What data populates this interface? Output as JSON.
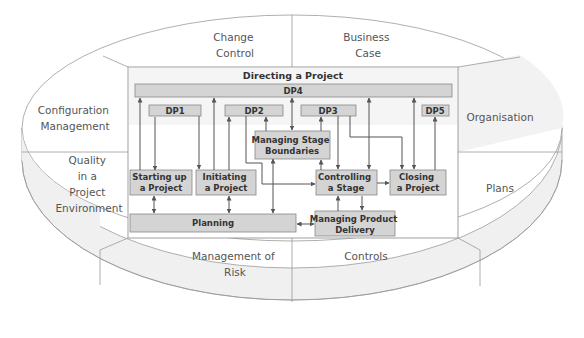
{
  "diagram": {
    "title": "Directing a Project",
    "colors": {
      "box_fill": "#d4d4d4",
      "box_stroke": "#888888",
      "line": "#555555",
      "ellipse_stroke": "#9a9a9a",
      "ellipse_shade": "#f0f0f0",
      "text": "#555555"
    },
    "outer_segments": [
      {
        "id": "change-control",
        "lines": [
          "Change",
          "Control"
        ]
      },
      {
        "id": "business-case",
        "lines": [
          "Business",
          "Case"
        ]
      },
      {
        "id": "organisation",
        "lines": [
          "Organisation"
        ]
      },
      {
        "id": "plans",
        "lines": [
          "Plans"
        ]
      },
      {
        "id": "controls",
        "lines": [
          "Controls"
        ]
      },
      {
        "id": "management-of-risk",
        "lines": [
          "Management of",
          "Risk"
        ]
      },
      {
        "id": "quality",
        "lines": [
          "Quality",
          "in a",
          "Project",
          "Environment"
        ]
      },
      {
        "id": "configuration-management",
        "lines": [
          "Configuration",
          "Management"
        ]
      }
    ],
    "processes": {
      "dp4": "DP4",
      "dp1": "DP1",
      "dp2": "DP2",
      "dp3": "DP3",
      "dp5": "DP5",
      "managing_stage_boundaries": [
        "Managing Stage",
        "Boundaries"
      ],
      "starting_up": [
        "Starting up",
        "a Project"
      ],
      "initiating": [
        "Initiating",
        "a Project"
      ],
      "controlling": [
        "Controlling",
        "a Stage"
      ],
      "closing": [
        "Closing",
        "a Project"
      ],
      "planning": "Planning",
      "managing_product_delivery": [
        "Managing Product",
        "Delivery"
      ]
    }
  }
}
